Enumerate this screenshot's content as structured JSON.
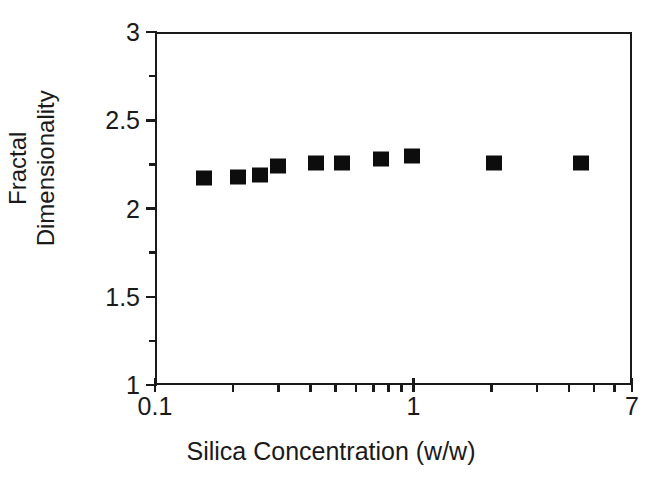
{
  "chart_data": {
    "type": "scatter",
    "title": "",
    "xlabel": "Silica Concentration (w/w)",
    "ylabel": "Fractal Dimensionality",
    "ylabel_lines": [
      "Fractal",
      "Dimensionality"
    ],
    "xscale": "log",
    "yscale": "linear",
    "xlim": [
      0.1,
      7
    ],
    "ylim": [
      1,
      3
    ],
    "grid": false,
    "legend": null,
    "x_tick_labels": [
      "0.1",
      "1",
      "7"
    ],
    "x_tick_values": [
      0.1,
      1,
      7
    ],
    "x_minor_ticks": [
      0.2,
      0.3,
      0.4,
      0.5,
      0.6,
      0.7,
      0.8,
      0.9,
      2,
      3,
      4,
      5,
      6
    ],
    "y_tick_labels": [
      "1",
      "1.5",
      "2",
      "2.5",
      "3"
    ],
    "y_tick_values": [
      1,
      1.5,
      2,
      2.5,
      3
    ],
    "y_minor_ticks": [
      1.25,
      1.75,
      2.25,
      2.75
    ],
    "marker": "filled-square",
    "marker_color": "#0d0d0d",
    "series": [
      {
        "name": "Fractal dimensionality vs silica concentration",
        "points": [
          {
            "x": 0.155,
            "y": 2.17
          },
          {
            "x": 0.21,
            "y": 2.18
          },
          {
            "x": 0.255,
            "y": 2.19
          },
          {
            "x": 0.3,
            "y": 2.24
          },
          {
            "x": 0.42,
            "y": 2.26
          },
          {
            "x": 0.53,
            "y": 2.26
          },
          {
            "x": 0.75,
            "y": 2.28
          },
          {
            "x": 0.99,
            "y": 2.3
          },
          {
            "x": 2.05,
            "y": 2.26
          },
          {
            "x": 4.45,
            "y": 2.26
          }
        ]
      }
    ]
  },
  "axes": {
    "x_title": "Silica Concentration (w/w)",
    "y_title_line1": "Fractal",
    "y_title_line2": "Dimensionality"
  }
}
